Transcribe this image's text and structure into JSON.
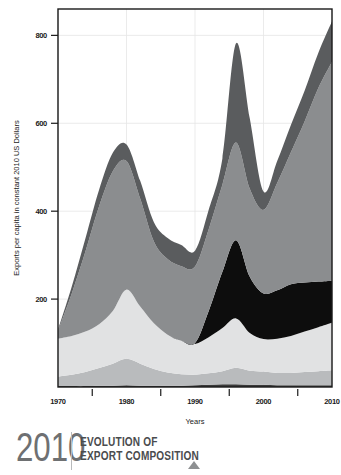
{
  "footer": {
    "year": "2010",
    "title_line1": "EVOLUTION OF",
    "title_line2": "EXPORT COMPOSITION",
    "marker_icon": "triangle-up-icon"
  },
  "chart_data": {
    "type": "area",
    "stacked": true,
    "title": "EVOLUTION OF EXPORT COMPOSITION",
    "xlabel": "Years",
    "ylabel": "Exports per capita in constant 2010 US Dollars",
    "xlim": [
      1970,
      2010
    ],
    "ylim": [
      0,
      860
    ],
    "xticks": [
      1970,
      1980,
      1990,
      2000,
      2010
    ],
    "xtick_labels": [
      "1970",
      "1980",
      "1990",
      "2000",
      "2010"
    ],
    "xminor_ticks": [
      1975,
      1985,
      1995,
      2005
    ],
    "yticks": [
      200,
      400,
      600,
      800
    ],
    "ytick_labels": [
      "200",
      "400",
      "600",
      "800"
    ],
    "grid": "faint",
    "legend": "none",
    "x": [
      1970,
      1972,
      1974,
      1976,
      1978,
      1980,
      1982,
      1984,
      1986,
      1988,
      1990,
      1992,
      1994,
      1996,
      1998,
      2000,
      2002,
      2004,
      2006,
      2008,
      2010
    ],
    "series": [
      {
        "name": "series-1-bottom-dark",
        "color": "#3a3a3a",
        "values": [
          2,
          2,
          2,
          3,
          3,
          4,
          3,
          3,
          3,
          3,
          4,
          5,
          6,
          6,
          5,
          5,
          4,
          4,
          4,
          4,
          4
        ]
      },
      {
        "name": "series-2-mid-light-gray",
        "color": "#b9bbbd",
        "values": [
          22,
          26,
          32,
          40,
          50,
          60,
          50,
          38,
          30,
          26,
          24,
          26,
          30,
          38,
          32,
          30,
          28,
          28,
          30,
          32,
          34
        ]
      },
      {
        "name": "series-3-pale-gray",
        "color": "#e1e2e3",
        "values": [
          86,
          88,
          92,
          100,
          120,
          158,
          130,
          104,
          86,
          76,
          70,
          82,
          98,
          112,
          86,
          74,
          78,
          84,
          92,
          100,
          108
        ]
      },
      {
        "name": "series-4-black",
        "color": "#0d0d0d",
        "values": [
          0,
          0,
          0,
          0,
          0,
          0,
          0,
          0,
          0,
          0,
          2,
          60,
          128,
          178,
          128,
          104,
          110,
          118,
          112,
          104,
          96
        ]
      },
      {
        "name": "series-5-medium-gray",
        "color": "#8b8d8f",
        "values": [
          18,
          96,
          182,
          268,
          318,
          292,
          246,
          186,
          172,
          170,
          174,
          186,
          198,
          222,
          200,
          190,
          244,
          300,
          366,
          440,
          498
        ]
      },
      {
        "name": "series-6-top-dark-gray",
        "color": "#5a5c5e",
        "values": [
          2,
          16,
          30,
          38,
          42,
          38,
          40,
          44,
          48,
          48,
          36,
          44,
          60,
          226,
          160,
          42,
          50,
          62,
          70,
          80,
          92
        ]
      }
    ]
  }
}
